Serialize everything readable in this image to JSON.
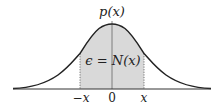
{
  "diagram": {
    "type": "normal-distribution-curve",
    "labels": {
      "y_axis": "p(x)",
      "area": "ϵ = N(x)",
      "tick_left": "−x",
      "tick_center": "0",
      "tick_right": "x"
    },
    "colors": {
      "curve": "#222222",
      "shaded_area": "#d9d9d9",
      "axis": "#333333",
      "dotted_bounds": "#555555"
    }
  }
}
